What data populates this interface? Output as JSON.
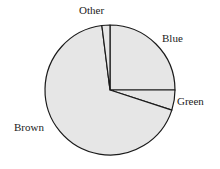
{
  "chart_data": {
    "type": "pie",
    "title": "",
    "categories": [
      "Blue",
      "Green",
      "Brown",
      "Other"
    ],
    "values": [
      25,
      5,
      68,
      2
    ],
    "unit": "percent",
    "start_angle_deg": 90,
    "direction": "clockwise",
    "fill_color": "#e6e6e6",
    "stroke_color": "#1a1a1a",
    "labels": {
      "blue": "Blue",
      "green": "Green",
      "brown": "Brown",
      "other": "Other"
    }
  }
}
